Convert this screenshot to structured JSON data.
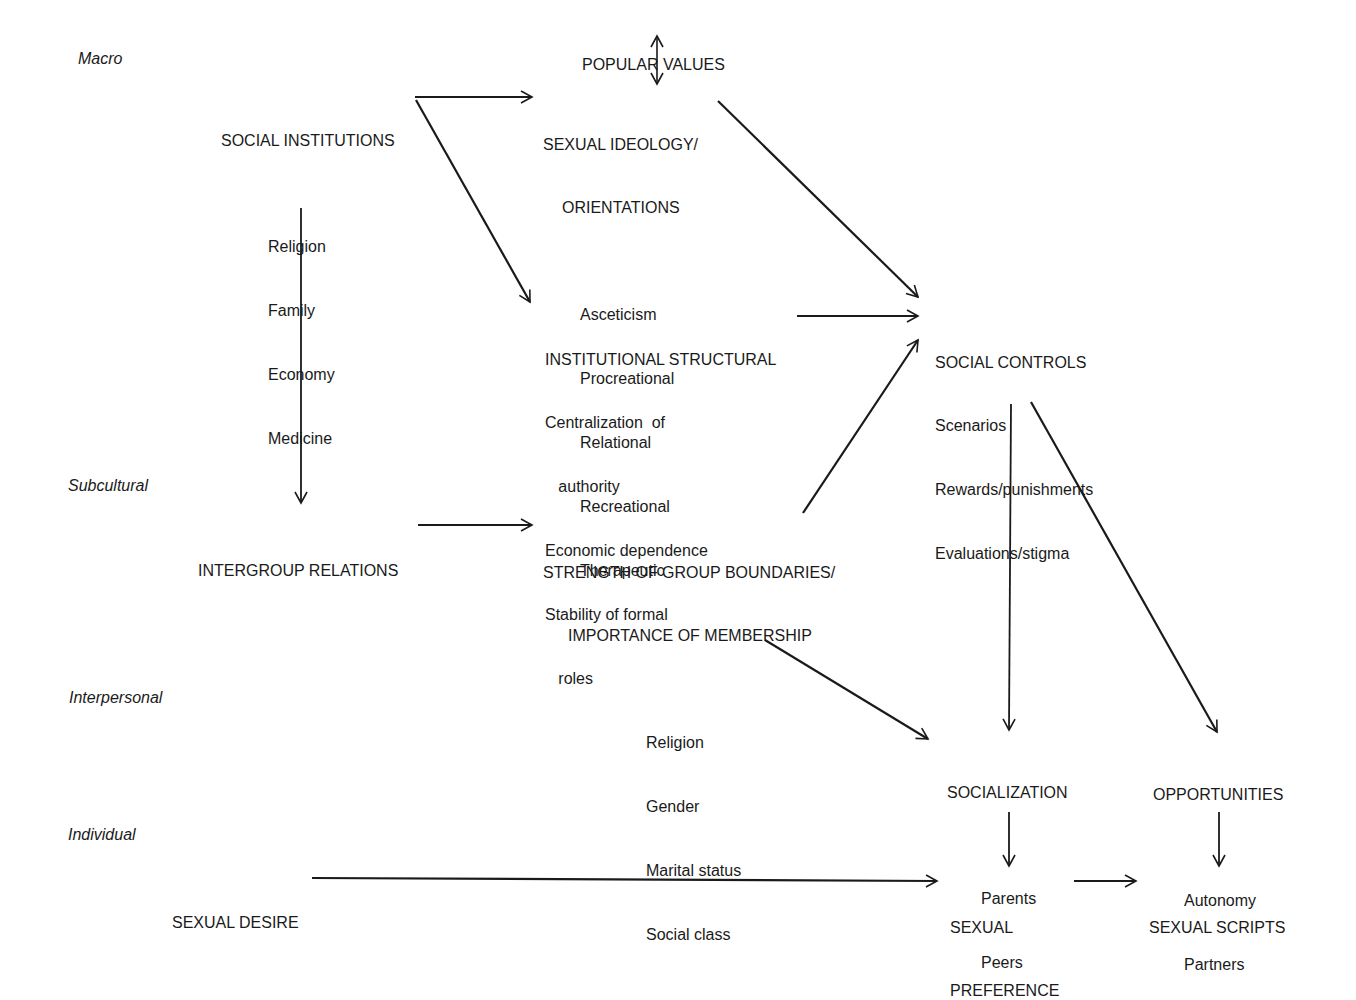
{
  "levels": [
    "Macro",
    "Subcultural",
    "Interpersonal",
    "Individual"
  ],
  "nodes": {
    "popular_values": {
      "title": "POPULAR VALUES"
    },
    "social_institutions": {
      "title": "SOCIAL INSTITUTIONS",
      "items": [
        "Religion",
        "Family",
        "Economy",
        "Medicine"
      ]
    },
    "sexual_ideology": {
      "title1": "SEXUAL IDEOLOGY/",
      "title2": "ORIENTATIONS",
      "items": [
        "Asceticism",
        "Procreational",
        "Relational",
        "Recreational",
        "Therapeutic"
      ]
    },
    "institutional_structural": {
      "title": "INSTITUTIONAL STRUCTURAL",
      "items": [
        "Centralization  of",
        "   authority",
        "Economic dependence",
        "Stability of formal",
        "   roles"
      ]
    },
    "social_controls": {
      "title": "SOCIAL CONTROLS",
      "items": [
        "Scenarios",
        "Rewards/punishments",
        "Evaluations/stigma"
      ]
    },
    "intergroup_relations": {
      "title": "INTERGROUP RELATIONS"
    },
    "group_boundaries": {
      "title1": "STRENGTH OF GROUP BOUNDARIES/",
      "title2": "IMPORTANCE OF MEMBERSHIP",
      "items": [
        "Religion",
        "Gender",
        "Marital status",
        "Social class"
      ]
    },
    "socialization": {
      "title": "SOCIALIZATION",
      "items": [
        "Parents",
        "Peers"
      ]
    },
    "opportunities": {
      "title": "OPPORTUNITIES",
      "items": [
        "Autonomy",
        "Partners"
      ]
    },
    "sexual_desire": {
      "title": "SEXUAL DESIRE"
    },
    "sexual_preference": {
      "title1": "SEXUAL",
      "title2": "PREFERENCE"
    },
    "sexual_scripts": {
      "title": "SEXUAL SCRIPTS"
    }
  },
  "edges": [
    [
      "popular_values",
      "sexual_ideology",
      "bidirectional"
    ],
    [
      "social_institutions",
      "sexual_ideology"
    ],
    [
      "social_institutions",
      "institutional_structural"
    ],
    [
      "social_institutions",
      "intergroup_relations"
    ],
    [
      "sexual_ideology",
      "social_controls"
    ],
    [
      "institutional_structural",
      "social_controls"
    ],
    [
      "group_boundaries",
      "social_controls"
    ],
    [
      "intergroup_relations",
      "group_boundaries"
    ],
    [
      "group_boundaries",
      "socialization"
    ],
    [
      "social_controls",
      "socialization"
    ],
    [
      "social_controls",
      "opportunities"
    ],
    [
      "socialization",
      "sexual_preference"
    ],
    [
      "opportunities",
      "sexual_scripts"
    ],
    [
      "sexual_desire",
      "sexual_preference"
    ],
    [
      "sexual_preference",
      "sexual_scripts"
    ]
  ]
}
